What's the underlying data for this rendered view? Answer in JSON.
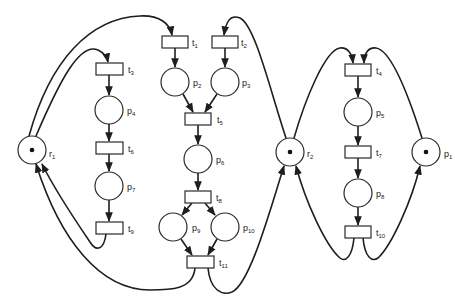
{
  "diagram": {
    "type": "petri-net",
    "colors": {
      "stroke": "#1e1e1e",
      "fill": "#ffffff",
      "token": "#111111",
      "background": "#ffffff"
    },
    "places": [
      {
        "id": "r1",
        "base": "r",
        "sub": "1",
        "cx": 32,
        "cy": 150,
        "tokens": 1
      },
      {
        "id": "r2",
        "base": "r",
        "sub": "2",
        "cx": 290,
        "cy": 152,
        "tokens": 1
      },
      {
        "id": "p1",
        "base": "p",
        "sub": "1",
        "cx": 426,
        "cy": 152,
        "tokens": 1
      },
      {
        "id": "p2",
        "base": "p",
        "sub": "2",
        "cx": 175,
        "cy": 82,
        "tokens": 0
      },
      {
        "id": "p3",
        "base": "p",
        "sub": "3",
        "cx": 225,
        "cy": 82,
        "tokens": 0
      },
      {
        "id": "p4",
        "base": "p",
        "sub": "4",
        "cx": 109,
        "cy": 110,
        "tokens": 0
      },
      {
        "id": "p5",
        "base": "p",
        "sub": "5",
        "cx": 358,
        "cy": 112,
        "tokens": 0
      },
      {
        "id": "p6",
        "base": "p",
        "sub": "6",
        "cx": 198,
        "cy": 159,
        "tokens": 0
      },
      {
        "id": "p7",
        "base": "p",
        "sub": "7",
        "cx": 109,
        "cy": 186,
        "tokens": 0
      },
      {
        "id": "p8",
        "base": "p",
        "sub": "8",
        "cx": 358,
        "cy": 193,
        "tokens": 0
      },
      {
        "id": "p9",
        "base": "p",
        "sub": "9",
        "cx": 173,
        "cy": 227,
        "tokens": 0
      },
      {
        "id": "p10",
        "base": "p",
        "sub": "10",
        "cx": 225,
        "cy": 227,
        "tokens": 0
      }
    ],
    "transitions": [
      {
        "id": "t1",
        "base": "t",
        "sub": "1",
        "cx": 175,
        "cy": 42
      },
      {
        "id": "t2",
        "base": "t",
        "sub": "2",
        "cx": 225,
        "cy": 42
      },
      {
        "id": "t3",
        "base": "t",
        "sub": "3",
        "cx": 109,
        "cy": 69
      },
      {
        "id": "t4",
        "base": "t",
        "sub": "4",
        "cx": 358,
        "cy": 70
      },
      {
        "id": "t5",
        "base": "t",
        "sub": "5",
        "cx": 198,
        "cy": 119
      },
      {
        "id": "t6",
        "base": "t",
        "sub": "6",
        "cx": 109,
        "cy": 148
      },
      {
        "id": "t7",
        "base": "t",
        "sub": "7",
        "cx": 358,
        "cy": 152
      },
      {
        "id": "t8",
        "base": "t",
        "sub": "8",
        "cx": 198,
        "cy": 197
      },
      {
        "id": "t9",
        "base": "t",
        "sub": "9",
        "cx": 109,
        "cy": 228
      },
      {
        "id": "t10",
        "base": "t",
        "sub": "10",
        "cx": 358,
        "cy": 232
      },
      {
        "id": "t11",
        "base": "t",
        "sub": "11",
        "cx": 200,
        "cy": 262
      }
    ],
    "arcs": [
      {
        "from": "r1",
        "to": "t3"
      },
      {
        "from": "r1",
        "to": "t1"
      },
      {
        "from": "r2",
        "to": "t2"
      },
      {
        "from": "t3",
        "to": "p4"
      },
      {
        "from": "p4",
        "to": "t6"
      },
      {
        "from": "t6",
        "to": "p7"
      },
      {
        "from": "p7",
        "to": "t9"
      },
      {
        "from": "t9",
        "to": "r1"
      },
      {
        "from": "t1",
        "to": "p2"
      },
      {
        "from": "t2",
        "to": "p3"
      },
      {
        "from": "p2",
        "to": "t5"
      },
      {
        "from": "p3",
        "to": "t5"
      },
      {
        "from": "t5",
        "to": "p6"
      },
      {
        "from": "p6",
        "to": "t8"
      },
      {
        "from": "t8",
        "to": "p9"
      },
      {
        "from": "t8",
        "to": "p10"
      },
      {
        "from": "p9",
        "to": "t11"
      },
      {
        "from": "p10",
        "to": "t11"
      },
      {
        "from": "t11",
        "to": "r1"
      },
      {
        "from": "t11",
        "to": "r2"
      },
      {
        "from": "r2",
        "to": "t4"
      },
      {
        "from": "p1",
        "to": "t4"
      },
      {
        "from": "t4",
        "to": "p5"
      },
      {
        "from": "p5",
        "to": "t7"
      },
      {
        "from": "t7",
        "to": "p8"
      },
      {
        "from": "p8",
        "to": "t10"
      },
      {
        "from": "t10",
        "to": "r2"
      },
      {
        "from": "t10",
        "to": "p1"
      }
    ]
  }
}
